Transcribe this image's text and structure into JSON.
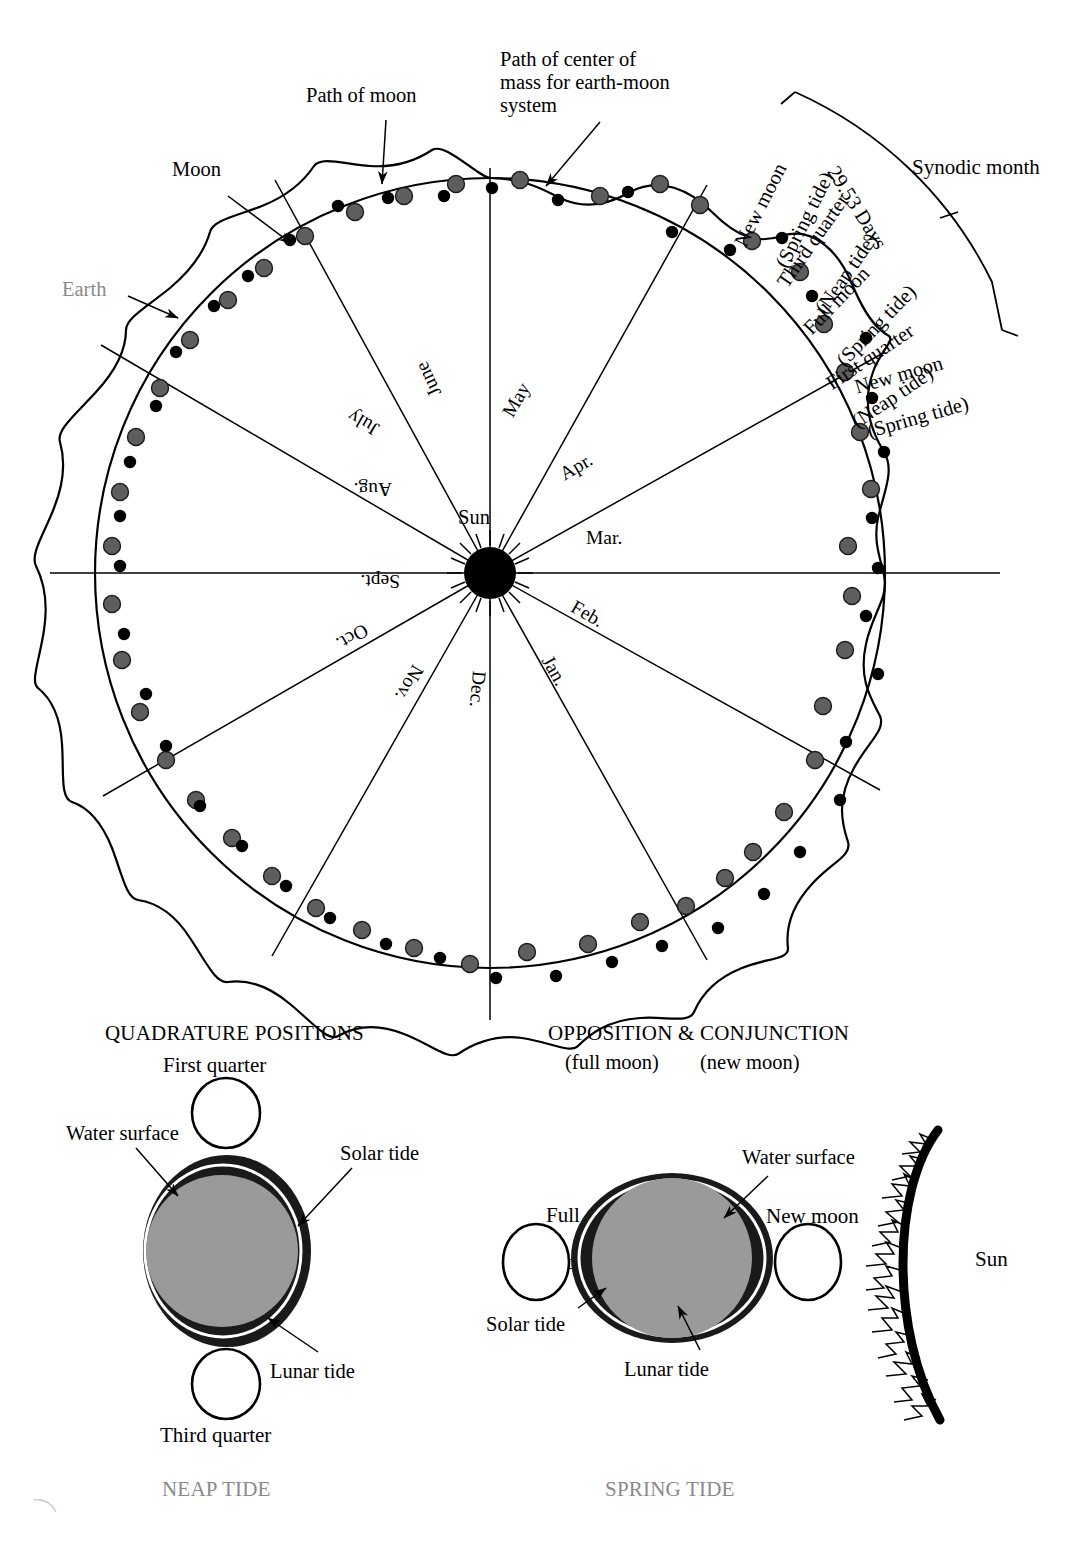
{
  "figure": {
    "title_implied": "Earth-Moon orbital path around the Sun with synodic month and tide diagrams",
    "sun_label": "Sun"
  },
  "orbit_diagram": {
    "callouts": {
      "path_of_moon": "Path of moon",
      "path_of_center_of_mass": "Path of center of\nmass for earth-moon\nsystem",
      "moon": "Moon",
      "earth": "Earth"
    },
    "months": [
      "Jan.",
      "Feb.",
      "Mar.",
      "Apr.",
      "May",
      "June",
      "July",
      "Aug.",
      "Sept.",
      "Oct.",
      "Nov.",
      "Dec."
    ],
    "synodic": {
      "bracket_label": "Synodic month",
      "duration_label": "29.53 Days",
      "phase_sequence": [
        "New moon\n(Spring tide)",
        "Third quarter\n(Neap tide)",
        "Full moon\n(Spring tide)",
        "First quarter\n(Neap tide)",
        "New moon\n(Spring tide)"
      ],
      "phase_1_line1": "New moon",
      "phase_1_line2": "(Spring tide)",
      "phase_2_line1": "Third quarter",
      "phase_2_line2": "(Neap tide)",
      "phase_3_line1": "Full moon",
      "phase_3_line2": "(Spring tide)",
      "phase_4_line1": "First quarter",
      "phase_4_line2": "(Neap tide)",
      "phase_5_line1": "New moon",
      "phase_5_line2": "(Spring tide)"
    }
  },
  "neap_panel": {
    "heading": "QUADRATURE POSITIONS",
    "moon_top": "First quarter",
    "moon_bottom": "Third quarter",
    "water_surface": "Water surface",
    "solar_tide": "Solar tide",
    "lunar_tide": "Lunar tide",
    "caption": "NEAP TIDE"
  },
  "spring_panel": {
    "heading": "OPPOSITION & CONJUNCTION",
    "sub_left": "(full moon)",
    "sub_right": "(new moon)",
    "moon_left_line1": "Full",
    "moon_left_line2": "moon",
    "moon_right": "New moon",
    "water_surface": "Water surface",
    "solar_tide": "Solar tide",
    "lunar_tide": "Lunar tide",
    "sun": "Sun",
    "caption": "SPRING TIDE"
  },
  "colors": {
    "ink": "#000000",
    "earth_marker": "#5e5e5e",
    "gray_text": "#8a8a8a",
    "earth_body_fill": "#9a9a9a",
    "tide_dark": "#1a1a1a"
  }
}
